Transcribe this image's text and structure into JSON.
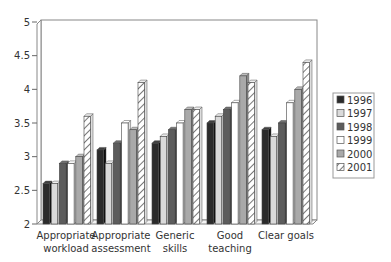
{
  "chart_data": {
    "type": "bar",
    "title": "",
    "xlabel": "",
    "ylabel": "",
    "ylim": [
      2,
      5
    ],
    "yticks": [
      "2",
      "2.5",
      "3",
      "3.5",
      "4",
      "4.5",
      "5"
    ],
    "grid": false,
    "legend_position": "right",
    "style": "3d clustered column",
    "categories": [
      [
        "Appropriate",
        "workload"
      ],
      [
        "Appropriate",
        "assessment"
      ],
      [
        "Generic",
        "skills"
      ],
      [
        "Good",
        "teaching"
      ],
      [
        "Clear goals"
      ]
    ],
    "category_labels": [
      "Appropriate workload",
      "Appropriate assessment",
      "Generic skills",
      "Good teaching",
      "Clear goals"
    ],
    "series": [
      {
        "name": "1996",
        "color": "#2b2b2b",
        "pattern": "solid",
        "values": [
          2.6,
          3.1,
          3.2,
          3.5,
          3.4
        ]
      },
      {
        "name": "1997",
        "color": "#dadada",
        "pattern": "solid",
        "values": [
          2.6,
          2.9,
          3.3,
          3.6,
          3.3
        ]
      },
      {
        "name": "1998",
        "color": "#5c5c5c",
        "pattern": "solid",
        "values": [
          2.9,
          3.2,
          3.4,
          3.7,
          3.5
        ]
      },
      {
        "name": "1999",
        "color": "#ffffff",
        "pattern": "solid",
        "values": [
          2.9,
          3.5,
          3.5,
          3.8,
          3.8
        ]
      },
      {
        "name": "2000",
        "color": "#a9a9a9",
        "pattern": "solid",
        "values": [
          3.0,
          3.4,
          3.7,
          4.2,
          4.0
        ]
      },
      {
        "name": "2001",
        "color": "#ffffff",
        "pattern": "hatched",
        "values": [
          3.6,
          4.1,
          3.7,
          4.1,
          4.4
        ]
      }
    ]
  }
}
